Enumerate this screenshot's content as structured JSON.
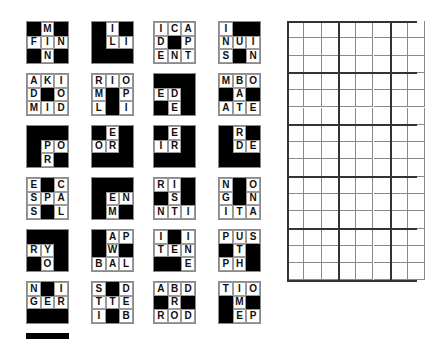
{
  "pieces": [
    {
      "cells": [
        [
          "#",
          "M",
          "#"
        ],
        [
          "F",
          "I",
          "N"
        ],
        [
          "#",
          "N",
          "#"
        ]
      ]
    },
    {
      "cells": [
        [
          "#",
          "I",
          "#"
        ],
        [
          "#",
          "L",
          "I"
        ],
        [
          "#",
          "#",
          "#"
        ]
      ]
    },
    {
      "cells": [
        [
          "I",
          "C",
          "A"
        ],
        [
          "D",
          "#",
          "P"
        ],
        [
          "E",
          "N",
          "T"
        ]
      ]
    },
    {
      "cells": [
        [
          "I",
          "#",
          "#"
        ],
        [
          "N",
          "U",
          "I"
        ],
        [
          "S",
          "#",
          "N"
        ]
      ]
    },
    {
      "cells": [
        [
          "A",
          "K",
          "I"
        ],
        [
          "D",
          "#",
          "O"
        ],
        [
          "M",
          "I",
          "D"
        ]
      ]
    },
    {
      "cells": [
        [
          "R",
          "I",
          "O"
        ],
        [
          "M",
          "#",
          "P"
        ],
        [
          "L",
          "#",
          "I"
        ]
      ]
    },
    {
      "cells": [
        [
          "#",
          "#",
          "#"
        ],
        [
          "E",
          "D",
          "#"
        ],
        [
          "#",
          "E",
          "#"
        ]
      ]
    },
    {
      "cells": [
        [
          "M",
          "B",
          "O"
        ],
        [
          "#",
          "A",
          "#"
        ],
        [
          "A",
          "T",
          "E"
        ]
      ]
    },
    {
      "cells": [
        [
          "#",
          "#",
          "#"
        ],
        [
          "#",
          "P",
          "O"
        ],
        [
          "#",
          "R",
          "#"
        ]
      ]
    },
    {
      "cells": [
        [
          "#",
          "E",
          "#"
        ],
        [
          "O",
          "R",
          "#"
        ],
        [
          "#",
          "#",
          "#"
        ]
      ]
    },
    {
      "cells": [
        [
          "#",
          "E",
          "#"
        ],
        [
          "I",
          "R",
          "#"
        ],
        [
          "#",
          "#",
          "#"
        ]
      ]
    },
    {
      "cells": [
        [
          "#",
          "R",
          "#"
        ],
        [
          "#",
          "D",
          "E"
        ],
        [
          "#",
          "#",
          "#"
        ]
      ]
    },
    {
      "cells": [
        [
          "E",
          "#",
          "C"
        ],
        [
          "S",
          "P",
          "A"
        ],
        [
          "S",
          "#",
          "L"
        ]
      ]
    },
    {
      "cells": [
        [
          "#",
          "#",
          "#"
        ],
        [
          "#",
          "E",
          "N"
        ],
        [
          "#",
          "M",
          "#"
        ]
      ]
    },
    {
      "cells": [
        [
          "R",
          "I",
          "#"
        ],
        [
          "#",
          "S",
          "#"
        ],
        [
          "N",
          "T",
          "I"
        ]
      ]
    },
    {
      "cells": [
        [
          "N",
          "#",
          "O"
        ],
        [
          "G",
          "#",
          "N"
        ],
        [
          "I",
          "T",
          "A"
        ]
      ]
    },
    {
      "cells": [
        [
          "#",
          "#",
          "#"
        ],
        [
          "R",
          "Y",
          "#"
        ],
        [
          "#",
          "O",
          "#"
        ]
      ]
    },
    {
      "cells": [
        [
          "#",
          "A",
          "P"
        ],
        [
          "#",
          "W",
          "#"
        ],
        [
          "B",
          "A",
          "L"
        ]
      ]
    },
    {
      "cells": [
        [
          "I",
          "#",
          "I"
        ],
        [
          "T",
          "E",
          "N"
        ],
        [
          "#",
          "#",
          "E"
        ]
      ]
    },
    {
      "cells": [
        [
          "P",
          "U",
          "S"
        ],
        [
          "#",
          "T",
          "#"
        ],
        [
          "P",
          "H",
          "#"
        ]
      ]
    },
    {
      "cells": [
        [
          "N",
          "#",
          "I"
        ],
        [
          "G",
          "E",
          "R"
        ],
        [
          "#",
          "#",
          "#"
        ]
      ]
    },
    {
      "cells": [
        [
          "S",
          "#",
          "D"
        ],
        [
          "T",
          "T",
          "E"
        ],
        [
          "I",
          "#",
          "B"
        ]
      ]
    },
    {
      "cells": [
        [
          "A",
          "B",
          "D"
        ],
        [
          "#",
          "R",
          "#"
        ],
        [
          "R",
          "O",
          "D"
        ]
      ]
    },
    {
      "cells": [
        [
          "T",
          "I",
          "O"
        ],
        [
          "#",
          "M",
          "#"
        ],
        [
          "#",
          "E",
          "P"
        ]
      ]
    }
  ],
  "board": {
    "rows": 15,
    "cols_visible": 7,
    "block": 3,
    "cell_px": 17.3
  }
}
